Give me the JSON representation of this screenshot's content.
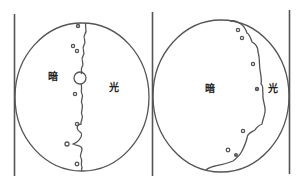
{
  "diagram": {
    "type": "optical-field-of-view",
    "colors": {
      "stroke": "#555555",
      "background": "#ffffff",
      "text": "#222222"
    },
    "panels": [
      {
        "id": "left",
        "labels": {
          "dark": "暗",
          "light": "光"
        },
        "boundary": "central wavy vertical line with one large ring and small dots"
      },
      {
        "id": "right",
        "labels": {
          "dark": "暗",
          "light": "光"
        },
        "boundary": "wavy line near right edge with small dots"
      }
    ]
  }
}
